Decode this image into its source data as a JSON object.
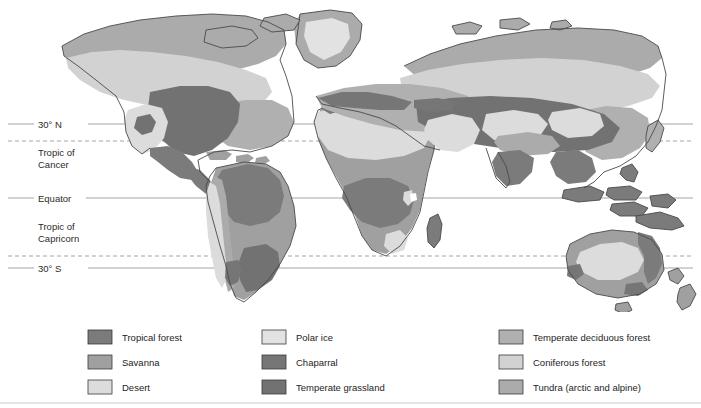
{
  "figure": {
    "kind": "world-biome-map",
    "background": "#ffffff"
  },
  "latitude_lines": [
    {
      "id": "thirty-north",
      "label": "30° N",
      "y": 124,
      "style": "solid",
      "label_lines": [
        "30° N"
      ]
    },
    {
      "id": "tropic-of-cancer",
      "label": "Tropic of Cancer",
      "y": 141,
      "style": "dashed",
      "label_lines": [
        "Tropic of",
        "Cancer"
      ]
    },
    {
      "id": "equator",
      "label": "Equator",
      "y": 198,
      "style": "solid",
      "label_lines": [
        "Equator"
      ]
    },
    {
      "id": "tropic-of-capricorn",
      "label": "Tropic of Capricorn",
      "y": 256,
      "style": "dashed",
      "label_lines": [
        "Tropic of",
        "Capricorn"
      ]
    },
    {
      "id": "thirty-south",
      "label": "30° S",
      "y": 268,
      "style": "solid",
      "label_lines": [
        "30° S"
      ]
    }
  ],
  "lat_text": {
    "thirty_north": "30° N",
    "tropic_cancer_1": "Tropic of",
    "tropic_cancer_2": "Cancer",
    "equator": "Equator",
    "tropic_capricorn_1": "Tropic of",
    "tropic_capricorn_2": "Capricorn",
    "thirty_south": "30° S"
  },
  "legend": {
    "columns": [
      {
        "items": [
          {
            "label": "Tropical forest",
            "color": "#7b7b7b",
            "key": "tropical-forest"
          },
          {
            "label": "Savanna",
            "color": "#a0a0a0",
            "key": "savanna"
          },
          {
            "label": "Desert",
            "color": "#dcdcdc",
            "key": "desert"
          }
        ]
      },
      {
        "items": [
          {
            "label": "Polar ice",
            "color": "#e2e2e2",
            "key": "polar-ice"
          },
          {
            "label": "Chaparral",
            "color": "#767676",
            "key": "chaparral"
          },
          {
            "label": "Temperate grassland",
            "color": "#727272",
            "key": "temperate-grassland"
          }
        ]
      },
      {
        "items": [
          {
            "label": "Temperate deciduous forest",
            "color": "#b0b0b0",
            "key": "temperate-deciduous-forest"
          },
          {
            "label": "Coniferous forest",
            "color": "#d2d2d2",
            "key": "coniferous-forest"
          },
          {
            "label": "Tundra (arctic and alpine)",
            "color": "#ababab",
            "key": "tundra"
          }
        ]
      }
    ]
  },
  "colors": {
    "tropical_forest": "#7b7b7b",
    "savanna": "#a0a0a0",
    "desert": "#dcdcdc",
    "polar_ice": "#e2e2e2",
    "chaparral": "#767676",
    "temperate_grassland": "#727272",
    "temperate_deciduous_forest": "#b0b0b0",
    "coniferous_forest": "#d2d2d2",
    "tundra": "#ababab",
    "coastline": "#4a4a4a",
    "latitude_line": "#9a9a9a",
    "text": "#1d1d1d",
    "ocean": "#ffffff"
  },
  "continents": [
    {
      "name": "North America",
      "key": "north-america"
    },
    {
      "name": "South America",
      "key": "south-america"
    },
    {
      "name": "Greenland",
      "key": "greenland"
    },
    {
      "name": "Africa",
      "key": "africa"
    },
    {
      "name": "Eurasia",
      "key": "eurasia"
    },
    {
      "name": "Australia",
      "key": "australia"
    },
    {
      "name": "New Zealand",
      "key": "new-zealand"
    }
  ]
}
